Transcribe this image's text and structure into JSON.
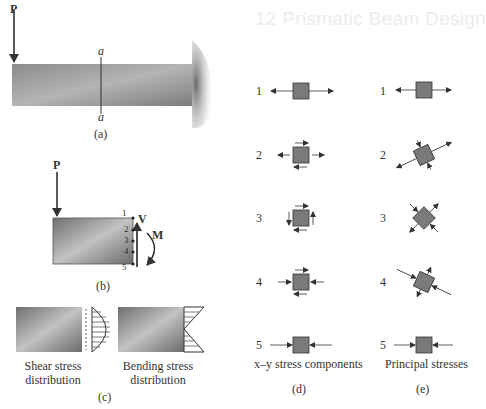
{
  "background_heading": "12  Prismatic Beam Design",
  "panel_a": {
    "load_label": "P",
    "section_top": "a",
    "section_bottom": "a",
    "caption": "(a)"
  },
  "panel_b": {
    "load_label": "P",
    "shear_label": "V",
    "moment_label": "M",
    "points": [
      "1",
      "2",
      "3",
      "4",
      "5"
    ],
    "caption": "(b)"
  },
  "panel_c": {
    "shear_title_line1": "Shear stress",
    "shear_title_line2": "distribution",
    "bending_title_line1": "Bending stress",
    "bending_title_line2": "distribution",
    "caption": "(c)"
  },
  "panel_d": {
    "rows": [
      "1",
      "2",
      "3",
      "4",
      "5"
    ],
    "title": "x–y stress components",
    "caption": "(d)"
  },
  "panel_e": {
    "rows": [
      "1",
      "2",
      "3",
      "4",
      "5"
    ],
    "title": "Principal stresses",
    "caption": "(e)"
  },
  "colors": {
    "beam_fill": "#8a8a8a",
    "element_fill": "#7a7a7a",
    "line": "#333333"
  }
}
